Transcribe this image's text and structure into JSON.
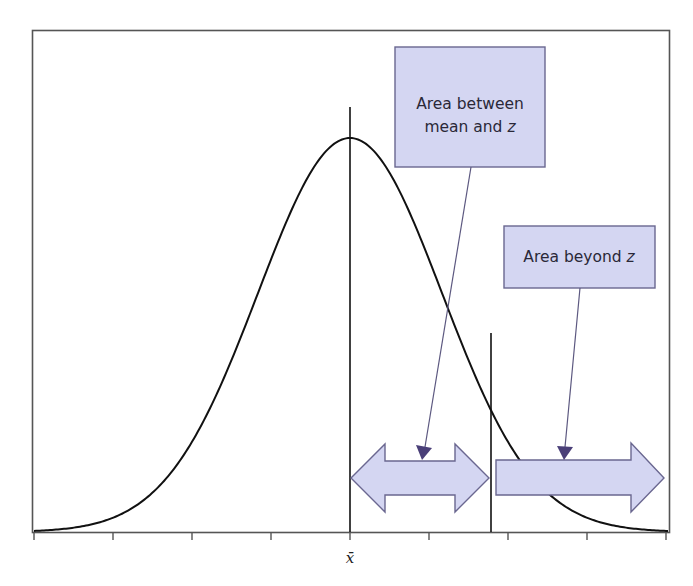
{
  "figure": {
    "colors": {
      "frame": "#555555",
      "curve": "#111111",
      "callout_fill": "#d4d6f2",
      "callout_stroke": "#6a6790",
      "pointer": "#5c5880",
      "pointer_head": "#4a3f78",
      "arrow_fill": "#d4d6f2",
      "arrow_stroke": "#6a6790"
    }
  },
  "callouts": [
    {
      "id": "between",
      "line1": "Area between",
      "line2": "mean and",
      "line2_italic": "z"
    },
    {
      "id": "beyond",
      "line1": "Area beyond",
      "line1_italic": "z"
    }
  ],
  "axis": {
    "mean_label": "x̄",
    "tick_count": 9
  },
  "chart_data": {
    "type": "line",
    "title": "",
    "xlabel": "",
    "ylabel": "",
    "x_label_mark": "x̄",
    "mean": 0,
    "sd": 1,
    "z": 1.53,
    "xlim": [
      -3.45,
      3.45
    ],
    "ticks_in_sd": [
      -3.44,
      -2.58,
      -1.72,
      -0.86,
      0,
      0.86,
      1.72,
      2.58,
      3.44
    ],
    "grid": false,
    "legend": null,
    "annotations": [
      {
        "text": "Area between mean and z",
        "points_to": "region from mean to z"
      },
      {
        "text": "Area beyond z",
        "points_to": "region beyond z (right tail)"
      }
    ]
  }
}
